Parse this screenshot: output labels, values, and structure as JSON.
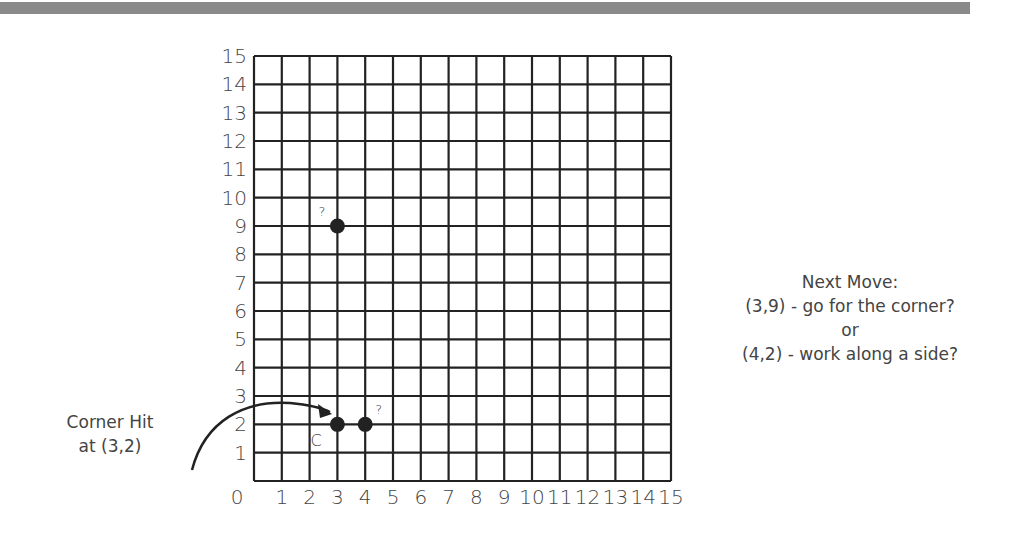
{
  "header_bar": {
    "color": "#8a8a8a"
  },
  "grid": {
    "x_min": 0,
    "x_max": 15,
    "y_min": 0,
    "y_max": 15,
    "x_labels": [
      "0",
      "1",
      "2",
      "3",
      "4",
      "5",
      "6",
      "7",
      "8",
      "9",
      "10",
      "11",
      "12",
      "13",
      "14",
      "15"
    ],
    "y_labels": [
      "1",
      "2",
      "3",
      "4",
      "5",
      "6",
      "7",
      "8",
      "9",
      "10",
      "11",
      "12",
      "13",
      "14",
      "15"
    ]
  },
  "points": [
    {
      "x": 3,
      "y": 2,
      "label": "C"
    },
    {
      "x": 4,
      "y": 2,
      "label": "?"
    },
    {
      "x": 3,
      "y": 9,
      "label": "?"
    }
  ],
  "left_note": {
    "line1": "Corner Hit",
    "line2": "at (3,2)"
  },
  "right_note": {
    "title": "Next Move:",
    "option1": "(3,9) - go for the corner?",
    "or": "or",
    "option2": "(4,2) - work along a side?"
  }
}
